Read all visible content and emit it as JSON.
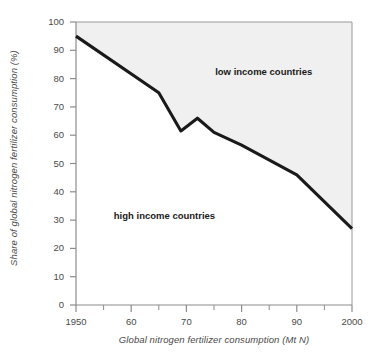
{
  "chart_data": {
    "type": "area",
    "title": "",
    "xlabel": "Global nitrogen fertilizer consumption (Mt N)",
    "ylabel": "Share of global nitrogen fertilizer consumption (%)",
    "xlim": [
      1950,
      2000
    ],
    "ylim": [
      0,
      100
    ],
    "grid": false,
    "legend_position": "inline-annotations",
    "x_ticks": [
      {
        "value": 1950,
        "label": "1950"
      },
      {
        "value": 1960,
        "label": "60"
      },
      {
        "value": 1970,
        "label": "70"
      },
      {
        "value": 1980,
        "label": "80"
      },
      {
        "value": 1990,
        "label": "90"
      },
      {
        "value": 2000,
        "label": "2000"
      }
    ],
    "x_minor_ticks": [
      1955,
      1965,
      1975,
      1985,
      1995
    ],
    "y_ticks": [
      {
        "value": 0,
        "label": "0"
      },
      {
        "value": 10,
        "label": "10"
      },
      {
        "value": 20,
        "label": "20"
      },
      {
        "value": 30,
        "label": "30"
      },
      {
        "value": 40,
        "label": "40"
      },
      {
        "value": 50,
        "label": "50"
      },
      {
        "value": 60,
        "label": "60"
      },
      {
        "value": 70,
        "label": "70"
      },
      {
        "value": 80,
        "label": "80"
      },
      {
        "value": 90,
        "label": "90"
      },
      {
        "value": 100,
        "label": "100"
      }
    ],
    "annotations": [
      {
        "id": "low-income",
        "text": "low income countries",
        "x": 1984,
        "y": 82
      },
      {
        "id": "high-income",
        "text": "high income countries",
        "x": 1966,
        "y": 31
      }
    ],
    "series": [
      {
        "name": "high income countries share",
        "x": [
          1950,
          1965,
          1969,
          1972,
          1975,
          1980,
          1990,
          2000
        ],
        "values": [
          95,
          75,
          61.5,
          66,
          61,
          56.5,
          46,
          27
        ]
      },
      {
        "name": "low income countries share",
        "note": "area above the line up to 100%",
        "x": [
          1950,
          1965,
          1969,
          1972,
          1975,
          1980,
          1990,
          2000
        ],
        "values": [
          5,
          25,
          38.5,
          34,
          39,
          43.5,
          54,
          73
        ]
      }
    ],
    "colors": {
      "line": "#1a1a1a",
      "fill_low_income": "#f0f0f0",
      "fill_high_income": "#ffffff",
      "axis": "#8c8c8c",
      "text": "#4a4a4a"
    }
  }
}
